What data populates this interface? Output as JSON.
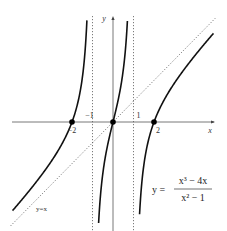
{
  "chart_data": {
    "type": "line",
    "title": "",
    "function": "y = (x^3 - 4x) / (x^2 - 1)",
    "formula": {
      "lhs": "y =",
      "numerator": "x³ − 4x",
      "denominator": "x² − 1"
    },
    "xlabel": "x",
    "ylabel": "y",
    "xlim": [
      -5,
      5
    ],
    "ylim": [
      -5.2,
      5.2
    ],
    "grid": false,
    "x_tick_labels": [
      {
        "value": -2,
        "label": "−2",
        "position": "below"
      },
      {
        "value": -1,
        "label": "−1",
        "position": "above"
      },
      {
        "value": 1,
        "label": "1",
        "position": "above"
      },
      {
        "value": 2,
        "label": "2",
        "position": "below"
      }
    ],
    "vertical_asymptotes": [
      -1,
      1
    ],
    "oblique_asymptote": {
      "label": "y=x",
      "slope": 1,
      "intercept": 0
    },
    "zeros": [
      -2,
      0,
      2
    ],
    "series": [
      {
        "name": "left branch",
        "domain": [
          -4.9,
          -1.25
        ]
      },
      {
        "name": "middle branch",
        "domain": [
          -0.78,
          0.78
        ]
      },
      {
        "name": "right branch",
        "domain": [
          1.25,
          4.9
        ]
      }
    ]
  }
}
